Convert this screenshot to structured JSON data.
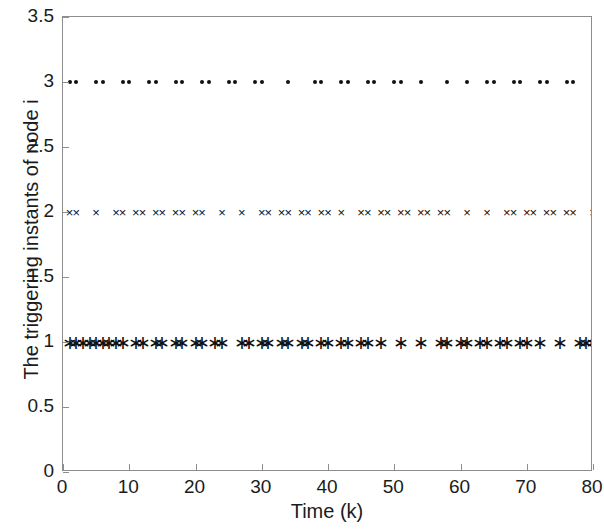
{
  "chart_data": {
    "type": "scatter",
    "title": "",
    "xlabel": "Time (k)",
    "ylabel": "The triggering instants of node i",
    "xlim": [
      0,
      80
    ],
    "ylim": [
      0,
      3.5
    ],
    "xticks": [
      0,
      10,
      20,
      30,
      40,
      50,
      60,
      70,
      80
    ],
    "xticklabels": [
      "0",
      "10",
      "20",
      "30",
      "40",
      "50",
      "60",
      "70",
      "80"
    ],
    "yticks": [
      0,
      0.5,
      1,
      1.5,
      2,
      2.5,
      3,
      3.5
    ],
    "yticklabels": [
      "0",
      "0.5",
      "1",
      "1.5",
      "2",
      "2.5",
      "3",
      "3.5"
    ],
    "grid": false,
    "legend": null,
    "series": [
      {
        "name": "node 1",
        "marker": "asterisk",
        "y": 1,
        "color": "#111111",
        "x": [
          1,
          2,
          3,
          4,
          5,
          6,
          7,
          8,
          9,
          11,
          12,
          14,
          15,
          17,
          18,
          20,
          21,
          23,
          24,
          27,
          28,
          30,
          31,
          33,
          34,
          36,
          37,
          39,
          40,
          42,
          43,
          45,
          46,
          48,
          51,
          54,
          57,
          58,
          60,
          61,
          63,
          64,
          66,
          67,
          69,
          70,
          72,
          75,
          78,
          79,
          80
        ]
      },
      {
        "name": "node 2",
        "marker": "cross",
        "y": 2,
        "color": "#111111",
        "x": [
          1,
          2,
          5,
          8,
          9,
          11,
          12,
          14,
          15,
          17,
          18,
          20,
          21,
          24,
          27,
          30,
          31,
          33,
          34,
          36,
          37,
          39,
          40,
          42,
          45,
          46,
          48,
          49,
          51,
          52,
          54,
          55,
          57,
          58,
          61,
          64,
          67,
          68,
          70,
          71,
          73,
          74,
          76,
          77,
          80
        ]
      },
      {
        "name": "node 3",
        "marker": "dot",
        "y": 3,
        "color": "#111111",
        "x": [
          1,
          2,
          5,
          6,
          9,
          10,
          13,
          14,
          17,
          18,
          21,
          22,
          25,
          26,
          29,
          30,
          34,
          38,
          39,
          42,
          43,
          46,
          47,
          50,
          51,
          54,
          58,
          61,
          64,
          65,
          68,
          69,
          72,
          73,
          76,
          77,
          80
        ]
      }
    ]
  },
  "axes": {
    "frame_color": "#8d8d8d",
    "tick_direction": "in"
  }
}
